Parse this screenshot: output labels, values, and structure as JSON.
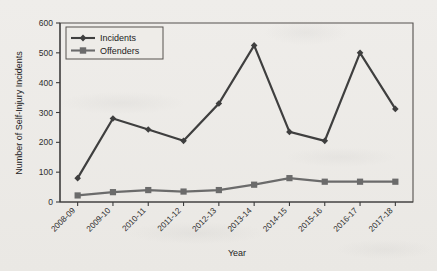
{
  "chart_data": {
    "type": "line",
    "title": "",
    "xlabel": "Year",
    "ylabel": "Number of Self-Injury Incidents",
    "categories": [
      "2008-09",
      "2009-10",
      "2010-11",
      "2011-12",
      "2012-13",
      "2013-14",
      "2014-15",
      "2015-16",
      "2016-17",
      "2017-18"
    ],
    "series": [
      {
        "name": "Incidents",
        "marker": "diamond",
        "color": "#3f3f3f",
        "values": [
          80,
          280,
          243,
          205,
          330,
          525,
          235,
          205,
          500,
          312
        ]
      },
      {
        "name": "Offenders",
        "marker": "square",
        "color": "#6b6b6b",
        "values": [
          22,
          33,
          40,
          35,
          40,
          58,
          80,
          68,
          68,
          68
        ]
      }
    ],
    "ylim": [
      0,
      600
    ],
    "yticks": [
      0,
      100,
      200,
      300,
      400,
      500,
      600
    ],
    "ytick_labels": [
      "0",
      "100",
      "200",
      "300",
      "400",
      "500",
      "600"
    ],
    "grid": false,
    "legend_position": "top-left",
    "legend_entries": [
      "Incidents",
      "Offenders"
    ]
  },
  "legend": {
    "incidents_label": "Incidents",
    "offenders_label": "Offenders"
  },
  "axes": {
    "y_title": "Number of Self-Injury Incidents",
    "x_title": "Year"
  },
  "colors": {
    "background": "#eeece8",
    "incidents": "#3f3f3f",
    "offenders": "#6b6b6b",
    "axis": "#3c3c3c",
    "frame": "#55514e",
    "text": "#232323"
  }
}
